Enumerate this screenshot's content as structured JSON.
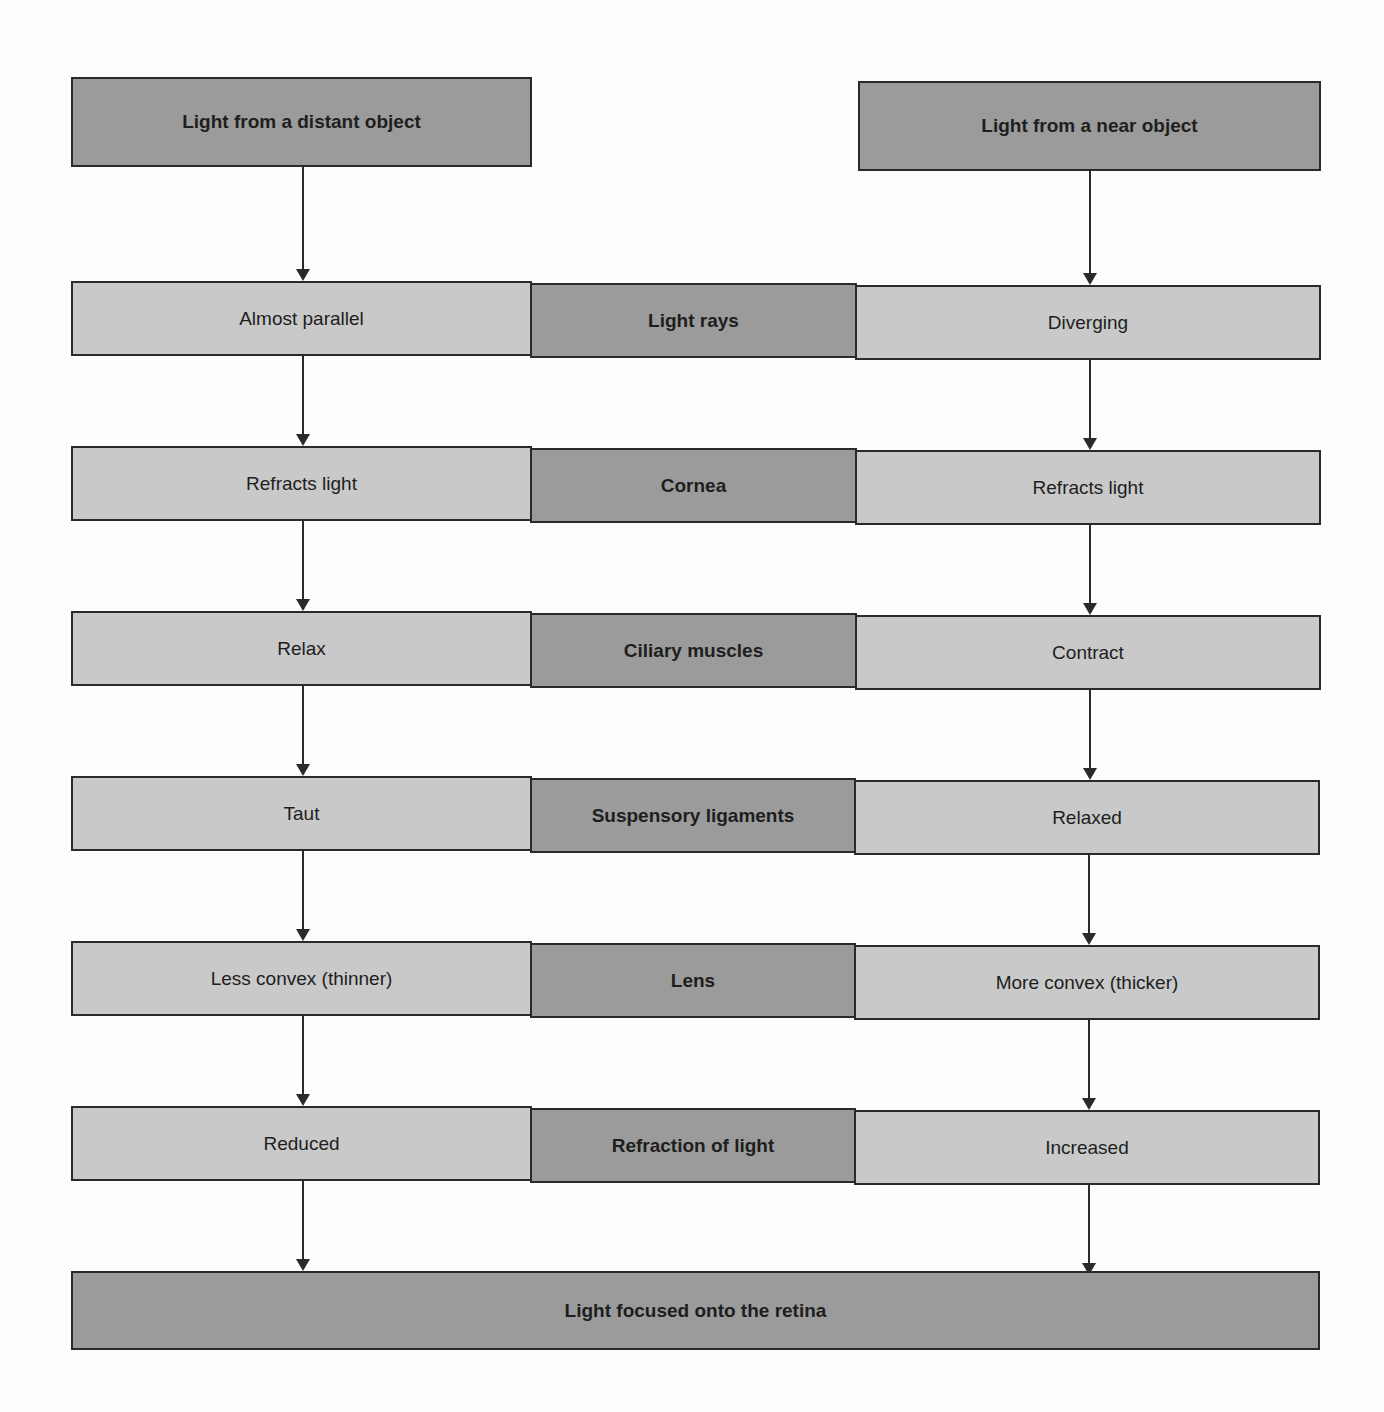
{
  "diagram": {
    "sources": {
      "distant": "Light from a distant object",
      "near": "Light from a near object"
    },
    "rows": [
      {
        "factor": "Light rays",
        "distant": "Almost parallel",
        "near": "Diverging"
      },
      {
        "factor": "Cornea",
        "distant": "Refracts light",
        "near": "Refracts light"
      },
      {
        "factor": "Ciliary muscles",
        "distant": "Relax",
        "near": "Contract"
      },
      {
        "factor": "Suspensory ligaments",
        "distant": "Taut",
        "near": "Relaxed"
      },
      {
        "factor": "Lens",
        "distant": "Less convex (thinner)",
        "near": "More convex (thicker)"
      },
      {
        "factor": "Refraction of light",
        "distant": "Reduced",
        "near": "Increased"
      }
    ],
    "outcome": "Light focused onto the retina",
    "colors": {
      "dark_fill": "#9b9b9b",
      "light_fill": "#c9c9c9",
      "border": "#2a2a2a"
    }
  }
}
